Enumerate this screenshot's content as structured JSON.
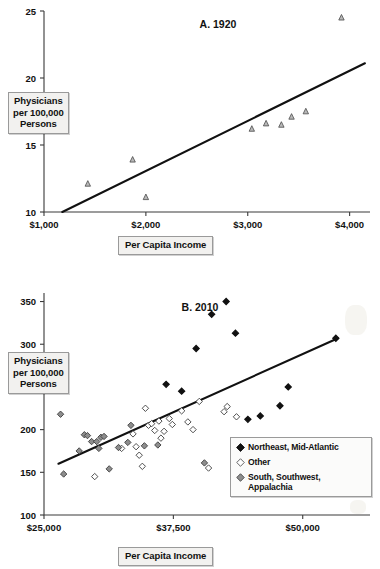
{
  "chart_data": [
    {
      "type": "scatter",
      "panel": "A",
      "title": "A. 1920",
      "xlabel": "Per Capita Income",
      "ylabel": "Physicians per 100,000 Persons",
      "ylabel_lines": [
        "Physicians",
        "per 100,000",
        "Persons"
      ],
      "xlim": [
        1000,
        4200
      ],
      "ylim": [
        10,
        25
      ],
      "xticks": [
        1000,
        2000,
        3000,
        4000
      ],
      "xticklabels": [
        "$1,000",
        "$2,000",
        "$3,000",
        "$4,000"
      ],
      "yticks": [
        10,
        15,
        20,
        25
      ],
      "yticklabels": [
        "10",
        "15",
        "20",
        "25"
      ],
      "grid": false,
      "legend": null,
      "marker": "open-triangle-gray",
      "series": [
        {
          "name": "States 1920",
          "marker": "triangle",
          "points": [
            {
              "x": 1430,
              "y": 12.1
            },
            {
              "x": 1870,
              "y": 13.9
            },
            {
              "x": 2000,
              "y": 11.1
            },
            {
              "x": 3040,
              "y": 16.2
            },
            {
              "x": 3180,
              "y": 16.6
            },
            {
              "x": 3330,
              "y": 16.5
            },
            {
              "x": 3430,
              "y": 17.1
            },
            {
              "x": 3570,
              "y": 17.5
            },
            {
              "x": 3920,
              "y": 24.5
            }
          ]
        }
      ],
      "trendline": {
        "x0": 1180,
        "y0": 10.0,
        "x1": 4150,
        "y1": 21.1
      }
    },
    {
      "type": "scatter",
      "panel": "B",
      "title": "B. 2010",
      "xlabel": "Per Capita Income",
      "ylabel": "Physicians per 100,000 Persons",
      "ylabel_lines": [
        "Physicians",
        "per 100,000",
        "Persons"
      ],
      "xlim": [
        25000,
        56500
      ],
      "ylim": [
        100,
        360
      ],
      "xticks": [
        25000,
        37500,
        50000
      ],
      "xticklabels": [
        "$25,000",
        "$37,500",
        "$50,000"
      ],
      "yticks": [
        100,
        150,
        200,
        250,
        300,
        350
      ],
      "yticklabels": [
        "100",
        "150",
        "200",
        "250",
        "300",
        "350"
      ],
      "yticklabels_visible": [
        "100",
        "150",
        "200",
        "300",
        "350"
      ],
      "grid": false,
      "legend": {
        "position": "bottom-right",
        "entries": [
          {
            "label": "Northeast, Mid-Atlantic",
            "marker": "filled-diamond",
            "color": "#111111"
          },
          {
            "label": "Other",
            "marker": "open-diamond",
            "color": "#ffffff"
          },
          {
            "label": "South, Southwest, Appalachia",
            "marker": "gray-diamond",
            "color": "#8a8a8a"
          }
        ]
      },
      "series": [
        {
          "name": "Northeast, Mid-Atlantic",
          "marker": "filled-diamond",
          "points": [
            {
              "x": 36800,
              "y": 253
            },
            {
              "x": 38300,
              "y": 245
            },
            {
              "x": 39700,
              "y": 295
            },
            {
              "x": 41200,
              "y": 335
            },
            {
              "x": 42600,
              "y": 350
            },
            {
              "x": 43500,
              "y": 313
            },
            {
              "x": 44700,
              "y": 212
            },
            {
              "x": 45900,
              "y": 216
            },
            {
              "x": 48600,
              "y": 250
            },
            {
              "x": 47800,
              "y": 228
            },
            {
              "x": 53200,
              "y": 307
            }
          ]
        },
        {
          "name": "Other",
          "marker": "open-diamond",
          "points": [
            {
              "x": 29900,
              "y": 145
            },
            {
              "x": 32500,
              "y": 178
            },
            {
              "x": 33600,
              "y": 195
            },
            {
              "x": 33900,
              "y": 180
            },
            {
              "x": 34200,
              "y": 170
            },
            {
              "x": 34500,
              "y": 157
            },
            {
              "x": 34800,
              "y": 225
            },
            {
              "x": 35100,
              "y": 205
            },
            {
              "x": 35400,
              "y": 207
            },
            {
              "x": 35700,
              "y": 199
            },
            {
              "x": 36100,
              "y": 210
            },
            {
              "x": 36300,
              "y": 190
            },
            {
              "x": 36600,
              "y": 198
            },
            {
              "x": 37100,
              "y": 213
            },
            {
              "x": 37400,
              "y": 206
            },
            {
              "x": 38300,
              "y": 222
            },
            {
              "x": 38900,
              "y": 209
            },
            {
              "x": 39400,
              "y": 200
            },
            {
              "x": 40000,
              "y": 233
            },
            {
              "x": 40900,
              "y": 155
            },
            {
              "x": 42400,
              "y": 221
            },
            {
              "x": 42700,
              "y": 227
            },
            {
              "x": 43600,
              "y": 215
            }
          ]
        },
        {
          "name": "South, Southwest, Appalachia",
          "marker": "gray-diamond",
          "points": [
            {
              "x": 26900,
              "y": 148
            },
            {
              "x": 26600,
              "y": 218
            },
            {
              "x": 28400,
              "y": 175
            },
            {
              "x": 28900,
              "y": 194
            },
            {
              "x": 29200,
              "y": 193
            },
            {
              "x": 29600,
              "y": 186
            },
            {
              "x": 30500,
              "y": 191
            },
            {
              "x": 30800,
              "y": 192
            },
            {
              "x": 30300,
              "y": 178
            },
            {
              "x": 31300,
              "y": 154
            },
            {
              "x": 32200,
              "y": 179
            },
            {
              "x": 33100,
              "y": 185
            },
            {
              "x": 33400,
              "y": 205
            },
            {
              "x": 34700,
              "y": 181
            },
            {
              "x": 36000,
              "y": 182
            },
            {
              "x": 40500,
              "y": 161
            },
            {
              "x": 30100,
              "y": 186
            }
          ]
        }
      ],
      "trendline": {
        "x0": 26400,
        "y0": 160,
        "x1": 53400,
        "y1": 307
      }
    }
  ]
}
